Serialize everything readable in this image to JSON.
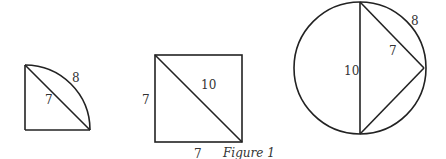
{
  "figure": {
    "caption": "Figure 1",
    "shapes": [
      {
        "type": "quarter-circle-sector",
        "labels": {
          "arc": "8",
          "chord": "7"
        }
      },
      {
        "type": "square-with-diagonal",
        "labels": {
          "left_side": "7",
          "bottom_side": "7",
          "diagonal": "10"
        }
      },
      {
        "type": "circle-with-diameter-and-inscribed-triangle",
        "labels": {
          "diameter": "10",
          "chord": "7",
          "arc": "8"
        }
      }
    ]
  },
  "colors": {
    "line": "#222222",
    "text": "#333333",
    "background": "#ffffff"
  }
}
